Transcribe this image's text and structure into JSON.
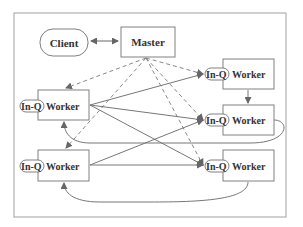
{
  "diagram": {
    "nodes": {
      "client": {
        "label": "Client"
      },
      "master": {
        "label": "Master"
      },
      "worker_left_top": {
        "queue": "In-Q",
        "label": "Worker"
      },
      "worker_left_bottom": {
        "queue": "In-Q",
        "label": "Worker"
      },
      "worker_right_top": {
        "queue": "In-Q",
        "label": "Worker"
      },
      "worker_right_middle": {
        "queue": "In-Q",
        "label": "Worker"
      },
      "worker_right_bottom": {
        "queue": "In-Q",
        "label": "Worker"
      }
    },
    "colors": {
      "stroke": "#808080",
      "text": "#333333",
      "frame": "#a0a0a0"
    }
  }
}
